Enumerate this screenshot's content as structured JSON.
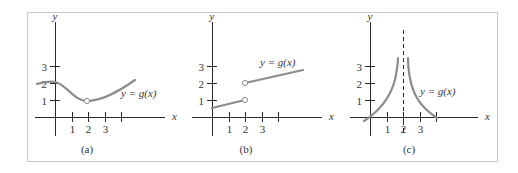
{
  "colors": {
    "curve": "#8c8c8c",
    "axis": "#2a2a2a",
    "frame": "#c8c8c8",
    "text": "#333333"
  },
  "chart_data": [
    {
      "id": "a",
      "type": "line",
      "caption": "(a)",
      "curve_label": "y = g(x)",
      "xlabel": "x",
      "ylabel": "y",
      "x_ticks": [
        "1",
        "2",
        "3"
      ],
      "y_ticks": [
        "1",
        "2",
        "3"
      ],
      "description": "Continuous curve starting near y=2 at x=-1, dipping to a minimum near (2,1) where there is a hole (open circle), then rising to about y=2.2 at x=4.8",
      "points": [
        [
          -1.1,
          2.0
        ],
        [
          0,
          2.05
        ],
        [
          1,
          1.5
        ],
        [
          2,
          1.0
        ],
        [
          3,
          1.3
        ],
        [
          4.8,
          2.2
        ]
      ],
      "open_points": [
        [
          2,
          1
        ]
      ],
      "xlim": [
        -1.2,
        6.7
      ],
      "ylim": [
        -1.3,
        4.3
      ]
    },
    {
      "id": "b",
      "type": "line",
      "caption": "(b)",
      "curve_label": "y = g(x)",
      "xlabel": "x",
      "ylabel": "y",
      "x_ticks": [
        "1",
        "2",
        "3"
      ],
      "y_ticks": [
        "1",
        "2",
        "3"
      ],
      "description": "Piecewise linear with jump at x=2: lower segment from (0,0.5) to open circle (2,1); upper segment from open circle (2,2) rising to about (5.5,2.8)",
      "segments": [
        {
          "points": [
            [
              0,
              0.5
            ],
            [
              2,
              1
            ]
          ]
        },
        {
          "points": [
            [
              2,
              2
            ],
            [
              5.5,
              2.8
            ]
          ]
        }
      ],
      "open_points": [
        [
          2,
          1
        ],
        [
          2,
          2
        ]
      ],
      "xlim": [
        -2.7,
        6.7
      ],
      "ylim": [
        -1.3,
        4.3
      ]
    },
    {
      "id": "c",
      "type": "line",
      "caption": "(c)",
      "curve_label": "y = g(x)",
      "xlabel": "x",
      "ylabel": "y",
      "x_ticks": [
        "1",
        "2",
        "3"
      ],
      "y_ticks": [
        "1",
        "2",
        "3"
      ],
      "description": "Vertical asymptote at x=2 (dashed line); both branches rise toward +infinity approaching x=2, crossing the x-axis near x=0 and x=4",
      "asymptote_x": 2,
      "segments": [
        {
          "points": [
            [
              -0.3,
              -0.25
            ],
            [
              0.5,
              0.5
            ],
            [
              1.2,
              1.4
            ],
            [
              1.6,
              2.3
            ],
            [
              1.75,
              3.5
            ]
          ]
        },
        {
          "points": [
            [
              2.3,
              3.5
            ],
            [
              2.45,
              2.3
            ],
            [
              2.8,
              1.4
            ],
            [
              3.5,
              0.5
            ],
            [
              4.0,
              0.0
            ]
          ]
        }
      ],
      "xlim": [
        -1.2,
        6.7
      ],
      "ylim": [
        -1.3,
        4.3
      ]
    }
  ],
  "panels": [
    {
      "ox": 55,
      "oy": 117,
      "ux": 16.5,
      "uy": 17,
      "xaxis": [
        35,
        165
      ],
      "yaxis": [
        22,
        136
      ],
      "xlabel_pos": [
        172,
        120
      ],
      "ylabel_pos": [
        55,
        20
      ],
      "tick_x_count": 4,
      "caption_pos": [
        87,
        153
      ],
      "curve_label_pos": [
        121,
        97
      ],
      "paths": [
        "M37,84 C45,82 50,81 55,82 C66,84 74,101 87,101 C100,101 118,92 135,80"
      ],
      "opens": [
        [
          87,
          101
        ]
      ],
      "dashed": null
    },
    {
      "ox": 212,
      "oy": 117,
      "ux": 16.5,
      "uy": 17,
      "xaxis": [
        192,
        322
      ],
      "yaxis": [
        22,
        136
      ],
      "xlabel_pos": [
        329,
        120
      ],
      "ylabel_pos": [
        212,
        20
      ],
      "tick_x_count": 4,
      "caption_pos": [
        246,
        153
      ],
      "curve_label_pos": [
        260,
        66
      ],
      "paths": [
        "M212,108 L245,100",
        "M245,83 L303,70"
      ],
      "opens": [
        [
          245,
          100
        ],
        [
          245,
          83
        ]
      ],
      "dashed": null
    },
    {
      "ox": 370,
      "oy": 117,
      "ux": 16.5,
      "uy": 17,
      "xaxis": [
        350,
        478
      ],
      "yaxis": [
        22,
        136
      ],
      "xlabel_pos": [
        485,
        120
      ],
      "ylabel_pos": [
        370,
        20
      ],
      "tick_x_count": 4,
      "caption_pos": [
        409,
        153
      ],
      "curve_label_pos": [
        420,
        95
      ],
      "paths": [
        "M364,121 C378,112 390,98 395,80 C397,70 398,64 398,58",
        "M408,58 C408,70 410,82 414,92 C420,106 430,113 437,118"
      ],
      "opens": [],
      "dashed": [
        403,
        30,
        133
      ]
    }
  ]
}
